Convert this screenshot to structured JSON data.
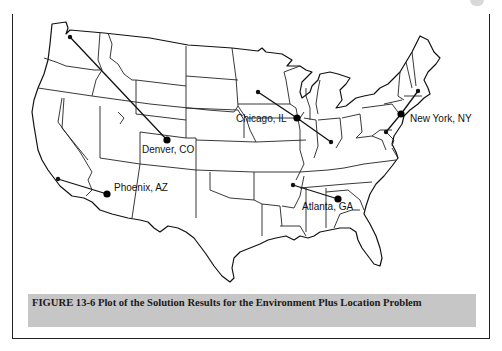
{
  "figure": {
    "caption": "FIGURE 13-6  Plot of the Solution Results for the Environment Plus Location Problem"
  },
  "map": {
    "region": "Contiguous United States",
    "facilities": [
      {
        "name": "Denver, CO",
        "x": 167,
        "y": 140
      },
      {
        "name": "Phoenix, AZ",
        "x": 107,
        "y": 194
      },
      {
        "name": "Chicago, IL",
        "x": 297,
        "y": 118
      },
      {
        "name": "New York, NY",
        "x": 401,
        "y": 114
      },
      {
        "name": "Atlanta, GA",
        "x": 338,
        "y": 199
      }
    ],
    "labels": {
      "denver": "Denver, CO",
      "phoenix": "Phoenix, AZ",
      "chicago": "Chicago, IL",
      "new_york": "New York, NY",
      "atlanta": "Atlanta, GA"
    },
    "assignments": [
      {
        "from": [
          70,
          37
        ],
        "to": "Denver, CO"
      },
      {
        "from": [
          58,
          179
        ],
        "to": "Phoenix, AZ"
      },
      {
        "from": [
          258,
          92
        ],
        "to": "Chicago, IL"
      },
      {
        "from": [
          331,
          142
        ],
        "to": "Chicago, IL"
      },
      {
        "from": [
          293,
          185
        ],
        "to": "Atlanta, GA"
      },
      {
        "from": [
          418,
          91
        ],
        "to": "New York, NY"
      },
      {
        "from": [
          386,
          132
        ],
        "to": "New York, NY"
      }
    ]
  }
}
